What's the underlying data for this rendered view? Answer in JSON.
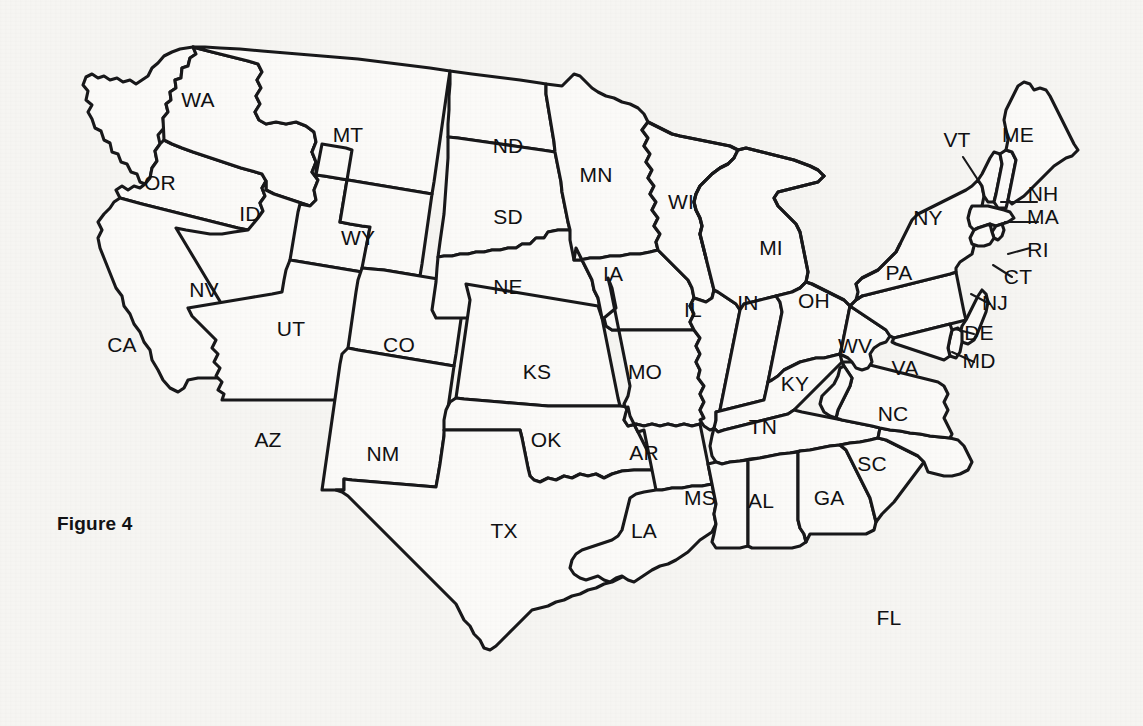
{
  "figure": {
    "caption": "Figure 4",
    "caption_x": 57,
    "caption_y": 513
  },
  "colors": {
    "background": "#f6f5f2",
    "state_fill": "#fbfaf8",
    "outline": "#18181a",
    "label_text": "#101012",
    "leader_line": "#18181a"
  },
  "map": {
    "type": "choropleth-outline",
    "region": "United States (contiguous 48 states)",
    "projection_note": "tilted / stylized",
    "stroke_width": 3.1,
    "label_count": 49,
    "has_leader_lines": true
  },
  "states": [
    {
      "abbr": "WA",
      "name": "Washington",
      "x": 198,
      "y": 107,
      "leader": null
    },
    {
      "abbr": "OR",
      "name": "Oregon",
      "x": 160,
      "y": 190,
      "leader": null
    },
    {
      "abbr": "CA",
      "name": "California",
      "x": 122,
      "y": 352,
      "leader": null
    },
    {
      "abbr": "ID",
      "name": "Idaho",
      "x": 250,
      "y": 221,
      "leader": null
    },
    {
      "abbr": "NV",
      "name": "Nevada",
      "x": 204,
      "y": 297,
      "leader": null
    },
    {
      "abbr": "UT",
      "name": "Utah",
      "x": 291,
      "y": 336,
      "leader": null
    },
    {
      "abbr": "AZ",
      "name": "Arizona",
      "x": 268,
      "y": 447,
      "leader": null
    },
    {
      "abbr": "MT",
      "name": "Montana",
      "x": 348,
      "y": 142,
      "leader": null
    },
    {
      "abbr": "WY",
      "name": "Wyoming",
      "x": 358,
      "y": 245,
      "leader": null
    },
    {
      "abbr": "CO",
      "name": "Colorado",
      "x": 399,
      "y": 352,
      "leader": null
    },
    {
      "abbr": "NM",
      "name": "New Mexico",
      "x": 383,
      "y": 461,
      "leader": null
    },
    {
      "abbr": "ND",
      "name": "North Dakota",
      "x": 508,
      "y": 153,
      "leader": null
    },
    {
      "abbr": "SD",
      "name": "South Dakota",
      "x": 508,
      "y": 224,
      "leader": null
    },
    {
      "abbr": "NE",
      "name": "Nebraska",
      "x": 508,
      "y": 294,
      "leader": null
    },
    {
      "abbr": "KS",
      "name": "Kansas",
      "x": 537,
      "y": 379,
      "leader": null
    },
    {
      "abbr": "OK",
      "name": "Oklahoma",
      "x": 546,
      "y": 447,
      "leader": null
    },
    {
      "abbr": "TX",
      "name": "Texas",
      "x": 504,
      "y": 538,
      "leader": null
    },
    {
      "abbr": "MN",
      "name": "Minnesota",
      "x": 596,
      "y": 182,
      "leader": null
    },
    {
      "abbr": "IA",
      "name": "Iowa",
      "x": 613,
      "y": 281,
      "leader": null
    },
    {
      "abbr": "MO",
      "name": "Missouri",
      "x": 645,
      "y": 379,
      "leader": null
    },
    {
      "abbr": "AR",
      "name": "Arkansas",
      "x": 644,
      "y": 460,
      "leader": null
    },
    {
      "abbr": "LA",
      "name": "Louisiana",
      "x": 644,
      "y": 538,
      "leader": null
    },
    {
      "abbr": "WI",
      "name": "Wisconsin",
      "x": 681,
      "y": 209,
      "leader": null
    },
    {
      "abbr": "IL",
      "name": "Illinois",
      "x": 693,
      "y": 317,
      "leader": null
    },
    {
      "abbr": "MI",
      "name": "Michigan",
      "x": 771,
      "y": 255,
      "leader": null
    },
    {
      "abbr": "IN",
      "name": "Indiana",
      "x": 748,
      "y": 310,
      "leader": null
    },
    {
      "abbr": "OH",
      "name": "Ohio",
      "x": 814,
      "y": 308,
      "leader": null
    },
    {
      "abbr": "KY",
      "name": "Kentucky",
      "x": 795,
      "y": 391,
      "leader": null
    },
    {
      "abbr": "TN",
      "name": "Tennessee",
      "x": 763,
      "y": 434,
      "leader": null
    },
    {
      "abbr": "MS",
      "name": "Mississippi",
      "x": 700,
      "y": 505,
      "leader": null
    },
    {
      "abbr": "AL",
      "name": "Alabama",
      "x": 761,
      "y": 508,
      "leader": null
    },
    {
      "abbr": "GA",
      "name": "Georgia",
      "x": 829,
      "y": 505,
      "leader": null
    },
    {
      "abbr": "FL",
      "name": "Florida",
      "x": 889,
      "y": 625,
      "leader": null
    },
    {
      "abbr": "SC",
      "name": "South Carolina",
      "x": 872,
      "y": 471,
      "leader": null
    },
    {
      "abbr": "NC",
      "name": "North Carolina",
      "x": 893,
      "y": 421,
      "leader": null
    },
    {
      "abbr": "VA",
      "name": "Virginia",
      "x": 905,
      "y": 375,
      "leader": null
    },
    {
      "abbr": "WV",
      "name": "West Virginia",
      "x": 855,
      "y": 353,
      "leader": null
    },
    {
      "abbr": "PA",
      "name": "Pennsylvania",
      "x": 899,
      "y": 280,
      "leader": null
    },
    {
      "abbr": "NY",
      "name": "New York",
      "x": 928,
      "y": 225,
      "leader": null
    },
    {
      "abbr": "ME",
      "name": "Maine",
      "x": 1018,
      "y": 142,
      "leader": null
    },
    {
      "abbr": "VT",
      "name": "Vermont",
      "x": 957,
      "y": 147,
      "leader": {
        "x1": 963,
        "y1": 157,
        "x2": 978,
        "y2": 180
      }
    },
    {
      "abbr": "NH",
      "name": "New Hampshire",
      "x": 1043,
      "y": 201,
      "leader": {
        "x1": 1001,
        "y1": 202,
        "x2": 1037,
        "y2": 202
      }
    },
    {
      "abbr": "MA",
      "name": "Massachusetts",
      "x": 1043,
      "y": 224,
      "leader": {
        "x1": 1005,
        "y1": 222,
        "x2": 1038,
        "y2": 222
      }
    },
    {
      "abbr": "RI",
      "name": "Rhode Island",
      "x": 1038,
      "y": 257,
      "leader": {
        "x1": 1008,
        "y1": 254,
        "x2": 1030,
        "y2": 248
      }
    },
    {
      "abbr": "CT",
      "name": "Connecticut",
      "x": 1018,
      "y": 284,
      "leader": {
        "x1": 993,
        "y1": 265,
        "x2": 1012,
        "y2": 277
      }
    },
    {
      "abbr": "NJ",
      "name": "New Jersey",
      "x": 995,
      "y": 310,
      "leader": {
        "x1": 971,
        "y1": 294,
        "x2": 990,
        "y2": 304
      }
    },
    {
      "abbr": "DE",
      "name": "Delaware",
      "x": 979,
      "y": 340,
      "leader": {
        "x1": 955,
        "y1": 329,
        "x2": 974,
        "y2": 334
      }
    },
    {
      "abbr": "MD",
      "name": "Maryland",
      "x": 979,
      "y": 368,
      "leader": {
        "x1": 952,
        "y1": 352,
        "x2": 974,
        "y2": 362
      }
    }
  ]
}
